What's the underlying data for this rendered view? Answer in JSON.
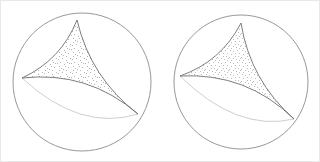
{
  "figure": {
    "title": "",
    "caption": "",
    "background_color": "#ffffff",
    "border_color": "#e8e8e8",
    "width": 320,
    "height": 162,
    "panel_count": 2
  },
  "style": {
    "sphere_stroke": "#8c8c8c",
    "patch_stroke": "#6f6f6f",
    "stipple_color": "#777777",
    "hidden_arc_stroke": "#b9b9b9",
    "fill": "#ffffff"
  },
  "panels": [
    {
      "id": "left-sphere",
      "label": "",
      "sphere": {
        "center_x": 81,
        "center_y": 81,
        "radius": 69
      },
      "patch": {
        "name": "spherical-triangle",
        "stipple_density": "medium",
        "vertices": [
          {
            "name": "top-vertex",
            "x": 76,
            "y": 19
          },
          {
            "name": "left-vertex",
            "x": 21,
            "y": 77
          },
          {
            "name": "bottom-right-vertex",
            "x": 137,
            "y": 113
          }
        ],
        "edges": [
          {
            "from": "top-vertex",
            "to": "left-vertex",
            "curvature": "convex-left"
          },
          {
            "from": "left-vertex",
            "to": "bottom-right-vertex",
            "curvature": "convex-down"
          },
          {
            "from": "bottom-right-vertex",
            "to": "top-vertex",
            "curvature": "convex-right"
          }
        ]
      }
    },
    {
      "id": "right-sphere",
      "label": "",
      "sphere": {
        "center_x": 240,
        "center_y": 81,
        "radius": 67
      },
      "patch": {
        "name": "spherical-triangle",
        "stipple_density": "high",
        "vertices": [
          {
            "name": "top-vertex",
            "x": 240,
            "y": 22
          },
          {
            "name": "left-vertex",
            "x": 179,
            "y": 75
          },
          {
            "name": "bottom-right-vertex",
            "x": 293,
            "y": 118
          }
        ],
        "edges": [
          {
            "from": "top-vertex",
            "to": "left-vertex",
            "curvature": "convex-left"
          },
          {
            "from": "left-vertex",
            "to": "bottom-right-vertex",
            "curvature": "convex-down"
          },
          {
            "from": "bottom-right-vertex",
            "to": "top-vertex",
            "curvature": "convex-right"
          }
        ]
      }
    }
  ]
}
